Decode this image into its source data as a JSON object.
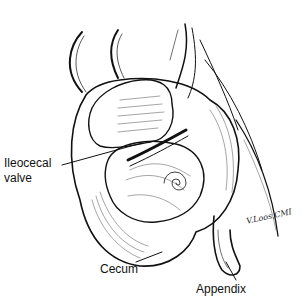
{
  "figure": {
    "labels": {
      "ileocecal_valve_line1": "Ileocecal",
      "ileocecal_valve_line2": "valve",
      "cecum": "Cecum",
      "appendix": "Appendix"
    },
    "signature": "V.Loos,CMI",
    "colors": {
      "ink": "#111111",
      "background": "#ffffff"
    }
  }
}
